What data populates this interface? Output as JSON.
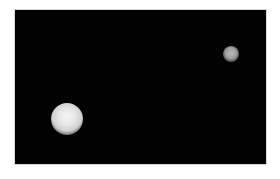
{
  "image": {
    "description": "Two blurry bright circular blobs on a black background",
    "background_color": "#020202",
    "border_color": "#d8d8d8",
    "objects": [
      {
        "name": "large-blob",
        "center": [
          67,
          119
        ],
        "radius": 16,
        "color": "#e6e6e6"
      },
      {
        "name": "small-blob",
        "center": [
          231,
          54
        ],
        "radius": 8,
        "color": "#a0a0a0"
      }
    ]
  }
}
